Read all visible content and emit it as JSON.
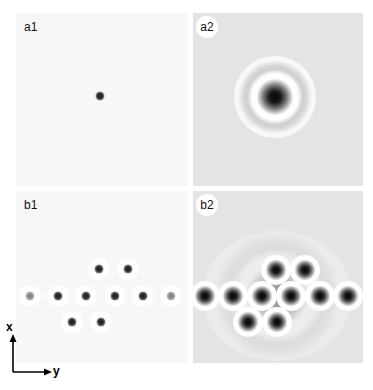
{
  "figure": {
    "panels": [
      {
        "id": "a1",
        "label": "a1",
        "kind": "simulation",
        "background": "#f7f7f7",
        "dots": [
          {
            "x": 84,
            "y": 83,
            "faint": false
          }
        ]
      },
      {
        "id": "a2",
        "label": "a2",
        "kind": "experiment",
        "background": "#e4e4e4",
        "dots": [
          {
            "x": 82,
            "y": 84
          }
        ]
      },
      {
        "id": "b1",
        "label": "b1",
        "kind": "simulation",
        "background": "#f7f7f7",
        "dots": [
          {
            "x": 83,
            "y": 78,
            "faint": false
          },
          {
            "x": 112,
            "y": 78,
            "faint": false
          },
          {
            "x": 14,
            "y": 105,
            "faint": true
          },
          {
            "x": 42,
            "y": 105,
            "faint": false
          },
          {
            "x": 70,
            "y": 105,
            "faint": false
          },
          {
            "x": 99,
            "y": 105,
            "faint": false
          },
          {
            "x": 127,
            "y": 105,
            "faint": false
          },
          {
            "x": 155,
            "y": 105,
            "faint": true
          },
          {
            "x": 56,
            "y": 131,
            "faint": false
          },
          {
            "x": 85,
            "y": 131,
            "faint": false
          }
        ]
      },
      {
        "id": "b2",
        "label": "b2",
        "kind": "experiment",
        "background": "#e4e4e4",
        "dots": [
          {
            "x": 83,
            "y": 79
          },
          {
            "x": 112,
            "y": 79
          },
          {
            "x": 12,
            "y": 105
          },
          {
            "x": 40,
            "y": 105
          },
          {
            "x": 69,
            "y": 105
          },
          {
            "x": 98,
            "y": 105
          },
          {
            "x": 127,
            "y": 105
          },
          {
            "x": 155,
            "y": 105
          },
          {
            "x": 55,
            "y": 131
          },
          {
            "x": 84,
            "y": 131
          }
        ]
      }
    ],
    "axes": {
      "vertical_label": "x",
      "horizontal_label": "y"
    }
  }
}
